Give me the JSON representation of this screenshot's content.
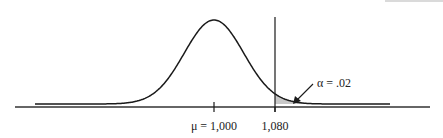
{
  "chart_data": {
    "type": "area",
    "title": "",
    "distribution": "normal",
    "mean": 1000,
    "critical_value": 1080,
    "alpha": 0.02,
    "shaded_region": "right-tail",
    "xlabel": "",
    "ylabel": "",
    "tick_labels": [
      "μ = 1,000",
      "1,080"
    ],
    "ticks": [
      1000,
      1080
    ],
    "annotation": "α = .02",
    "grid": false,
    "legend": "none"
  },
  "colors": {
    "curve": "#1a1a1a",
    "shade": "#c8c8c8",
    "axis": "#333333"
  }
}
